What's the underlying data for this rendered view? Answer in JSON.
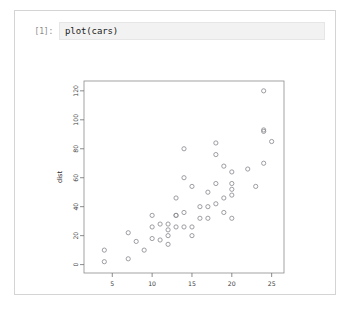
{
  "notebook": {
    "cell": {
      "prompt": "[1]:",
      "code": "plot(cars)"
    }
  },
  "colors": {
    "card_border": "#d4d4d4",
    "input_bg": "#f2f2f2",
    "input_border": "#e6e6e6",
    "prompt_text": "#8a8a8a",
    "code_text": "#1a1a1a",
    "axis": "#6e6e6e",
    "panel": "#8c8c8c",
    "point": "#8d8d93",
    "page_bg": "#ffffff"
  },
  "chart_data": {
    "type": "scatter",
    "title": "",
    "xlabel": "speed",
    "ylabel": "dist",
    "xlim": [
      1.45,
      26.55
    ],
    "ylim": [
      -5.8,
      126.8
    ],
    "xticks": [
      5,
      10,
      15,
      20,
      25
    ],
    "yticks": [
      0,
      20,
      40,
      60,
      80,
      100,
      120
    ],
    "xtick_labels": [
      "5",
      "10",
      "15",
      "20",
      "25"
    ],
    "ytick_labels": [
      "0",
      "20",
      "40",
      "60",
      "80",
      "100",
      "120"
    ],
    "grid": false,
    "legend": false,
    "marker": "open-circle",
    "n_points": 50,
    "x": [
      4,
      4,
      7,
      7,
      8,
      9,
      10,
      10,
      10,
      11,
      11,
      12,
      12,
      12,
      12,
      13,
      13,
      13,
      13,
      14,
      14,
      14,
      14,
      15,
      15,
      15,
      16,
      16,
      17,
      17,
      17,
      18,
      18,
      18,
      18,
      19,
      19,
      19,
      20,
      20,
      20,
      20,
      20,
      22,
      23,
      24,
      24,
      24,
      24,
      25
    ],
    "y": [
      2,
      10,
      4,
      22,
      16,
      10,
      18,
      26,
      34,
      17,
      28,
      14,
      20,
      24,
      28,
      26,
      34,
      34,
      46,
      26,
      36,
      60,
      80,
      20,
      26,
      54,
      32,
      40,
      32,
      40,
      50,
      42,
      56,
      76,
      84,
      36,
      46,
      68,
      32,
      48,
      52,
      56,
      64,
      66,
      54,
      70,
      92,
      93,
      120,
      85
    ]
  }
}
